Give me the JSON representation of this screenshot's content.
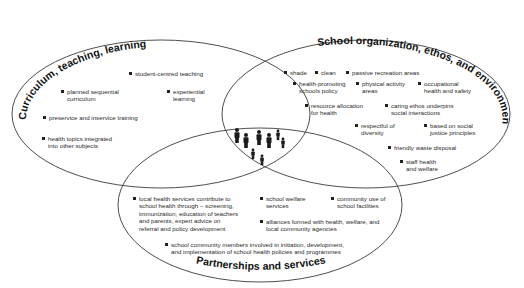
{
  "diagram": {
    "type": "venn",
    "sets": [
      {
        "id": "curriculum",
        "title": "Curriculum, teaching, learning",
        "items": [
          "student-centred teaching",
          "planned sequential\ncurriculum",
          "experiential\nlearning",
          "preservice and inservice training",
          "health topics integrated\ninto other subjects"
        ]
      },
      {
        "id": "organization",
        "title": "School organization, ethos, and environment",
        "items": [
          "shade",
          "clean",
          "passive recreation areas",
          "health-promoting\nschools policy",
          "physical activity\nareas",
          "occupational\nhealth and safety",
          "resource allocation\nfor health",
          "caring ethos underpins\nsocial interactions",
          "respectful of\ndiversity",
          "based on social\njustice principles",
          "friendly waste disposal",
          "staff health\nand welfare"
        ]
      },
      {
        "id": "partnerships",
        "title": "Partnerships and services",
        "items": [
          "local health services contribute to\nschool health through – screening,\nimmunization, education of teachers\nand parents, expert advice on\nreferral and policy development",
          "school welfare\nservices",
          "community use of\nschool facilities",
          "alliances formed with health, welfare, and\nlocal community agencies",
          "school community members involved in initiation, development,\nand implementation of school health policies and programmes"
        ]
      }
    ],
    "center": {
      "icon": "people-group-icon",
      "count": 7
    },
    "colors": {
      "stroke": "#3a3a3a",
      "text": "#222222",
      "background": "#ffffff"
    }
  }
}
